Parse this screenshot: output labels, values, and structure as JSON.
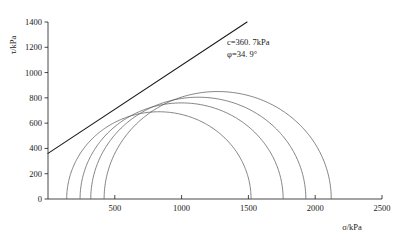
{
  "chart_data": {
    "type": "line",
    "title": "",
    "xlabel": "σ/kPa",
    "ylabel": "τ/kPa",
    "xlim": [
      0,
      2500
    ],
    "ylim": [
      0,
      1400
    ],
    "xticks": [
      0,
      500,
      1000,
      1500,
      2000,
      2500
    ],
    "xtick_labels": [
      "0",
      "500",
      "1000",
      "1500",
      "2000",
      "2500"
    ],
    "yticks": [
      0,
      200,
      400,
      600,
      800,
      1000,
      1200,
      1400
    ],
    "ytick_labels": [
      "0",
      "200",
      "400",
      "600",
      "800",
      "1000",
      "1200",
      "1400"
    ],
    "grid": false,
    "legend": null,
    "annotations": [
      {
        "name": "cohesion",
        "text": "c=360. 7kPa",
        "x": 1340,
        "y": 1220
      },
      {
        "name": "friction-angle",
        "text": "φ=34. 9°",
        "x": 1340,
        "y": 1120
      }
    ],
    "series": [
      {
        "name": "failure-envelope",
        "type": "line",
        "cohesion": 360.7,
        "friction_angle_deg": 34.9,
        "slope": 0.6976,
        "intercept": 360.7,
        "x_start": 0,
        "x_end": 1490,
        "y_start": 360.7,
        "y_end": 1400
      },
      {
        "name": "mohr-circle-1",
        "type": "circle",
        "sigma3": 140,
        "sigma1": 1520,
        "center": 830,
        "radius": 690
      },
      {
        "name": "mohr-circle-2",
        "type": "circle",
        "sigma3": 240,
        "sigma1": 1760,
        "center": 1000,
        "radius": 760
      },
      {
        "name": "mohr-circle-3",
        "type": "circle",
        "sigma3": 320,
        "sigma1": 1930,
        "center": 1125,
        "radius": 805
      },
      {
        "name": "mohr-circle-4",
        "type": "circle",
        "sigma3": 420,
        "sigma1": 2120,
        "center": 1270,
        "radius": 850
      }
    ]
  }
}
